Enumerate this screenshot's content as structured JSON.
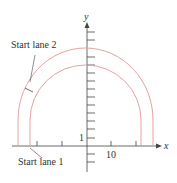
{
  "diagram": {
    "axis_labels": {
      "x": "x",
      "y": "y"
    },
    "tick_labels": {
      "x_10": "10",
      "y_1": "1"
    },
    "annotations": {
      "lane2": "Start lane 2",
      "lane1": "Start lane 1"
    },
    "colors": {
      "curve": "#e8a0a0",
      "axis": "#333333"
    }
  }
}
